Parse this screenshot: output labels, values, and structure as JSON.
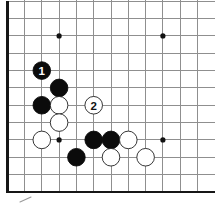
{
  "diagram": {
    "kind": "go-board-corner-diagram",
    "background": "#ffffff",
    "canvas": {
      "width": 215,
      "height": 205
    },
    "board": {
      "visible_cols": 12,
      "visible_rows": 12,
      "origin_x": 7.2,
      "origin_bottom_y": 191.9,
      "spacing_x": 17.3,
      "spacing_y": 17.33,
      "grid_line_color": "#8f8f8f",
      "grid_line_width": 1,
      "edge_color": "#161616",
      "edge_width": 2.8,
      "edges_visible": {
        "left": true,
        "bottom": true,
        "top": false,
        "right": false
      },
      "cut_top_y": 0,
      "cut_right_x": 215
    },
    "star_points": {
      "radius": 2.6,
      "color": "#111111",
      "points": [
        {
          "col": 4,
          "row": 10
        },
        {
          "col": 10,
          "row": 10
        },
        {
          "col": 4,
          "row": 4
        },
        {
          "col": 10,
          "row": 4
        }
      ]
    },
    "stones": {
      "radius": 8.8,
      "black_fill": "#0b0b0b",
      "black_stroke": "#0b0b0b",
      "white_fill": "#ffffff",
      "white_stroke": "#1f1f1f",
      "stroke_width": 0.9,
      "label_font_size": 11.5,
      "black_label_color": "#ffffff",
      "white_label_color": "#111111",
      "list": [
        {
          "color": "black",
          "col": 3,
          "row": 8,
          "label": "1"
        },
        {
          "color": "black",
          "col": 4,
          "row": 7,
          "label": ""
        },
        {
          "color": "black",
          "col": 3,
          "row": 6,
          "label": ""
        },
        {
          "color": "white",
          "col": 4,
          "row": 6,
          "label": ""
        },
        {
          "color": "white",
          "col": 6,
          "row": 6,
          "label": "2"
        },
        {
          "color": "white",
          "col": 4,
          "row": 5,
          "label": ""
        },
        {
          "color": "white",
          "col": 3,
          "row": 4,
          "label": ""
        },
        {
          "color": "black",
          "col": 6,
          "row": 4,
          "label": ""
        },
        {
          "color": "black",
          "col": 7,
          "row": 4,
          "label": ""
        },
        {
          "color": "white",
          "col": 8,
          "row": 4,
          "label": ""
        },
        {
          "color": "black",
          "col": 5,
          "row": 3,
          "label": ""
        },
        {
          "color": "white",
          "col": 7,
          "row": 3,
          "label": ""
        },
        {
          "color": "white",
          "col": 9,
          "row": 3,
          "label": ""
        }
      ]
    },
    "margin_mark": {
      "x1": 20,
      "y1": 202,
      "x2": 31,
      "y2": 197,
      "color": "#9a9a9a",
      "width": 1.1
    }
  }
}
